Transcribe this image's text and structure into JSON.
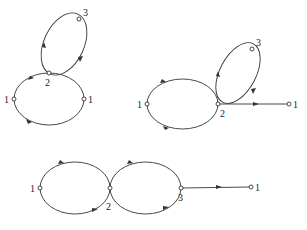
{
  "diagrams": [
    {
      "id": "top-left",
      "nodes": [
        {
          "label": "3",
          "x": 79,
          "y": 19,
          "lx": 83,
          "ly": 16
        },
        {
          "label": "2",
          "x": 49,
          "y": 73,
          "lx": 45,
          "ly": 86
        },
        {
          "label": "1",
          "x": 14,
          "y": 99,
          "lx": 4,
          "ly": 103
        },
        {
          "label": "1",
          "x": 84,
          "y": 99,
          "lx": 88,
          "ly": 103
        }
      ]
    },
    {
      "id": "top-right",
      "nodes": [
        {
          "label": "3",
          "x": 252,
          "y": 49,
          "lx": 256,
          "ly": 46
        },
        {
          "label": "2",
          "x": 218,
          "y": 104,
          "lx": 220,
          "ly": 117
        },
        {
          "label": "1",
          "x": 147,
          "y": 104,
          "lx": 137,
          "ly": 108
        },
        {
          "label": "1",
          "x": 289,
          "y": 104,
          "lx": 293,
          "ly": 108
        }
      ]
    },
    {
      "id": "bottom",
      "nodes": [
        {
          "label": "1",
          "x": 40,
          "y": 188,
          "lx": 30,
          "ly": 192
        },
        {
          "label": "2",
          "x": 110,
          "y": 188,
          "lx": 106,
          "ly": 210
        },
        {
          "label": "3",
          "x": 181,
          "y": 188,
          "lx": 178,
          "ly": 201
        },
        {
          "label": "1",
          "x": 251,
          "y": 187,
          "lx": 255,
          "ly": 191
        }
      ]
    }
  ]
}
